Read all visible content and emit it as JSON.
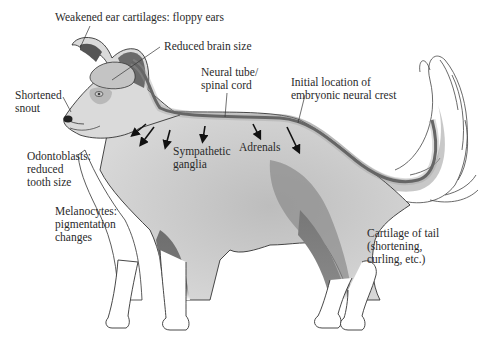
{
  "figure": {
    "colors": {
      "neural_tube": "#4a4a4a",
      "neural_crest_band": "#9a9a9a",
      "dark_fur": "#6e6e6e",
      "mid_fur": "#b5b5b5",
      "outline": "#333333",
      "label_text": "#2a2a2a",
      "background": "#ffffff"
    }
  },
  "labels": {
    "ear": "Weakened ear cartilages: floppy ears",
    "brain": "Reduced brain size",
    "snout_line1": "Shortened",
    "snout_line2": "snout",
    "neural_tube_line1": "Neural tube/",
    "neural_tube_line2": "spinal cord",
    "neural_crest_line1": "Initial location of",
    "neural_crest_line2": "embryonic neural crest",
    "odontoblasts_line1": "Odontoblasts:",
    "odontoblasts_line2": "reduced",
    "odontoblasts_line3": "tooth size",
    "sympathetic_line1": "Sympathetic",
    "sympathetic_line2": "ganglia",
    "adrenals": "Adrenals",
    "melanocytes_line1": "Melanocytes:",
    "melanocytes_line2": "pigmentation",
    "melanocytes_line3": "changes",
    "tail_line1": "Cartilage of tail",
    "tail_line2": "(shortening,",
    "tail_line3": "curling, etc.)"
  },
  "icons": {
    "migration_arrows": "arrow-down-icon",
    "count": 7
  }
}
